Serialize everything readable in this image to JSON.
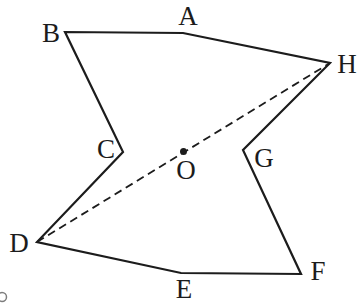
{
  "figure": {
    "canvas": {
      "width": 363,
      "height": 303
    },
    "colors": {
      "background": "#ffffff",
      "stroke": "#1c1c1c",
      "label": "#1c1c1c",
      "artifact": "#7d7d7d"
    },
    "style": {
      "edge_width": 2.2,
      "dash_width": 1.8,
      "dash_pattern": "8 5",
      "dot_radius": 3.5,
      "label_font_size": 27
    },
    "polygon_order": [
      "A",
      "B",
      "C",
      "D",
      "E",
      "F",
      "G",
      "H"
    ],
    "vertices": [
      {
        "id": "A",
        "label": "A",
        "x": 183,
        "y": 33,
        "label_x": 188,
        "label_y": 16
      },
      {
        "id": "B",
        "label": "B",
        "x": 65,
        "y": 32,
        "label_x": 51,
        "label_y": 33
      },
      {
        "id": "C",
        "label": "C",
        "x": 123,
        "y": 152,
        "label_x": 106,
        "label_y": 149
      },
      {
        "id": "D",
        "label": "D",
        "x": 37,
        "y": 242,
        "label_x": 19,
        "label_y": 243
      },
      {
        "id": "E",
        "label": "E",
        "x": 181,
        "y": 273,
        "label_x": 184,
        "label_y": 289
      },
      {
        "id": "F",
        "label": "F",
        "x": 301,
        "y": 274,
        "label_x": 318,
        "label_y": 271
      },
      {
        "id": "G",
        "label": "G",
        "x": 243,
        "y": 150,
        "label_x": 264,
        "label_y": 158
      },
      {
        "id": "H",
        "label": "H",
        "x": 330,
        "y": 63,
        "label_x": 347,
        "label_y": 64
      }
    ],
    "dashed_segment": {
      "from": "D",
      "to": "H"
    },
    "center_point": {
      "id": "O",
      "label": "O",
      "x": 183.5,
      "y": 151.5,
      "label_x": 186,
      "label_y": 170
    },
    "corner_artifact": {
      "cx": 2,
      "cy": 297,
      "r": 4.5,
      "stroke_width": 1.5
    }
  }
}
